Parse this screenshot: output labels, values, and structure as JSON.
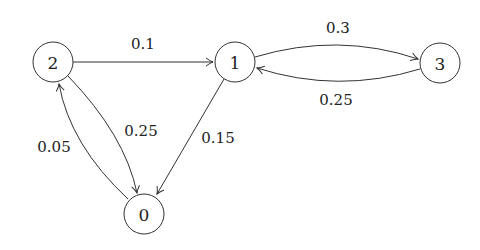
{
  "diagram": {
    "type": "markov-chain",
    "nodes": [
      {
        "id": "0",
        "label": "0",
        "x": 144,
        "y": 214
      },
      {
        "id": "1",
        "label": "1",
        "x": 235,
        "y": 62
      },
      {
        "id": "2",
        "label": "2",
        "x": 53,
        "y": 62
      },
      {
        "id": "3",
        "label": "3",
        "x": 440,
        "y": 63
      }
    ],
    "edges": [
      {
        "from": "2",
        "to": "1",
        "label": "0.1"
      },
      {
        "from": "1",
        "to": "3",
        "label": "0.3"
      },
      {
        "from": "3",
        "to": "1",
        "label": "0.25"
      },
      {
        "from": "2",
        "to": "0",
        "label": "0.25"
      },
      {
        "from": "0",
        "to": "2",
        "label": "0.05"
      },
      {
        "from": "1",
        "to": "0",
        "label": "0.15"
      }
    ]
  }
}
